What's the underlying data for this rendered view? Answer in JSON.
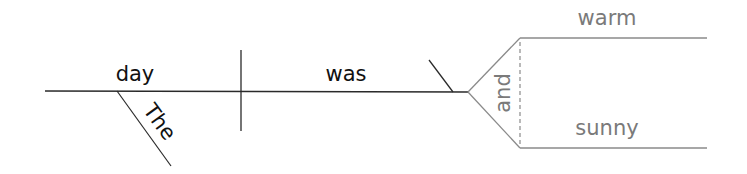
{
  "diagram": {
    "type": "sentence-diagram",
    "sentence": "The day was warm and sunny",
    "subject": "day",
    "verb": "was",
    "subject_modifier": "The",
    "conjunction": "and",
    "predicate_adjectives": [
      "warm",
      "sunny"
    ],
    "colors": {
      "main_line": "#2a2a2a",
      "compound_line": "#8a8a8a",
      "main_text": "#111111",
      "compound_text": "#7a7a7a"
    }
  }
}
